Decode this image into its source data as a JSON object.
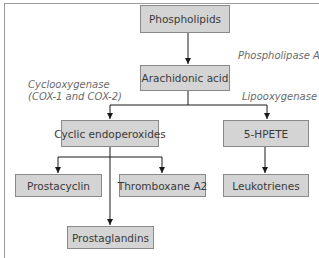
{
  "diagram": {
    "type": "flowchart",
    "nodes": {
      "phospholipids": "Phospholipids",
      "arachidonic_acid": "Arachidonic acid",
      "cyclic_endoperoxides": "Cyclic endoperoxides",
      "hpete": "5-HPETE",
      "prostacyclin": "Prostacyclin",
      "thromboxane": "Thromboxane A2",
      "leukotrienes": "Leukotrienes",
      "prostaglandins": "Prostaglandins"
    },
    "enzymes": {
      "phospholipase": "Phospholipase A2",
      "cyclooxygenase_line1": "Cyclooxygenase",
      "cyclooxygenase_line2": "(COX-1 and COX-2)",
      "lipooxygenase": "Lipooxygenase"
    },
    "edges": [
      {
        "from": "Phospholipids",
        "to": "Arachidonic acid",
        "label": "Phospholipase A2"
      },
      {
        "from": "Arachidonic acid",
        "to": "Cyclic endoperoxides",
        "label": "Cyclooxygenase (COX-1 and COX-2)"
      },
      {
        "from": "Arachidonic acid",
        "to": "5-HPETE",
        "label": "Lipooxygenase"
      },
      {
        "from": "Cyclic endoperoxides",
        "to": "Prostacyclin"
      },
      {
        "from": "Cyclic endoperoxides",
        "to": "Thromboxane A2"
      },
      {
        "from": "Cyclic endoperoxides",
        "to": "Prostaglandins"
      },
      {
        "from": "5-HPETE",
        "to": "Leukotrienes"
      }
    ],
    "colors": {
      "box_fill": "#d4d4d4",
      "box_border": "#8a8a8a",
      "text": "#3a3a3a",
      "label_text": "#6a6a6a",
      "frame": "#9a9a9a"
    }
  }
}
